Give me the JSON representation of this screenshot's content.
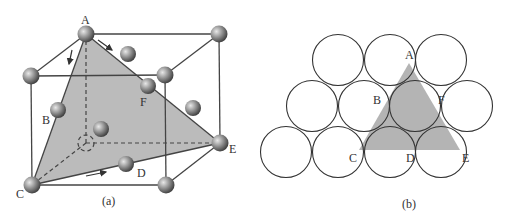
{
  "figure_a": {
    "caption": "(a)",
    "labels": {
      "A": "A",
      "B": "B",
      "C": "C",
      "D": "D",
      "E": "E",
      "F": "F"
    },
    "plane_fill": "#b4b4b4"
  },
  "figure_b": {
    "caption": "(b)",
    "labels": {
      "A": "A",
      "B": "B",
      "C": "C",
      "D": "D",
      "E": "E",
      "F": "F"
    },
    "triangle_fill": "#b4b4b4"
  }
}
